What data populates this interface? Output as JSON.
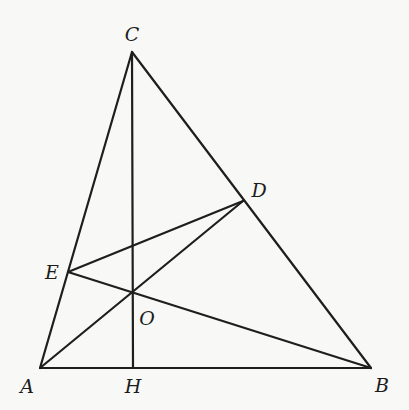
{
  "diagram": {
    "type": "geometry-triangle",
    "stroke_color": "#1e1e1e",
    "background": "#f8f8f6",
    "points": {
      "A": {
        "x": 40,
        "y": 368
      },
      "B": {
        "x": 371,
        "y": 368
      },
      "C": {
        "x": 132,
        "y": 52
      },
      "D": {
        "x": 243,
        "y": 201
      },
      "E": {
        "x": 68,
        "y": 272
      },
      "H": {
        "x": 133,
        "y": 368
      },
      "O": {
        "x": 133,
        "y": 293
      }
    },
    "segments": [
      [
        "A",
        "B"
      ],
      [
        "B",
        "C"
      ],
      [
        "C",
        "A"
      ],
      [
        "C",
        "H"
      ],
      [
        "A",
        "D"
      ],
      [
        "B",
        "E"
      ],
      [
        "E",
        "D"
      ]
    ],
    "labels": [
      {
        "text": "C",
        "x": 132,
        "y": 34
      },
      {
        "text": "D",
        "x": 259,
        "y": 190
      },
      {
        "text": "E",
        "x": 52,
        "y": 272
      },
      {
        "text": "O",
        "x": 147,
        "y": 318
      },
      {
        "text": "A",
        "x": 27,
        "y": 386
      },
      {
        "text": "H",
        "x": 133,
        "y": 386
      },
      {
        "text": "B",
        "x": 382,
        "y": 385
      }
    ]
  }
}
